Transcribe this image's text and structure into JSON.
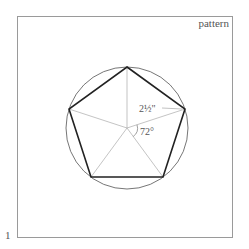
{
  "figure": {
    "label": "pattern",
    "page_number": "1",
    "annotations": {
      "radius": "2½\"",
      "angle": "72°"
    },
    "shape": {
      "type": "regular pentagon inscribed in circle",
      "sides": 5,
      "center_angle_deg": 72
    },
    "colors": {
      "outline": "#222222",
      "thin_line": "#999999",
      "frame": "#9a9a9a"
    }
  }
}
